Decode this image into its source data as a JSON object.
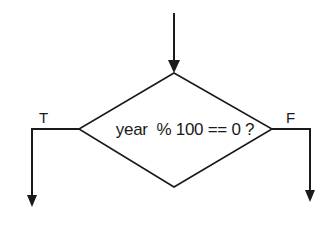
{
  "diagram": {
    "type": "flowchart-decision",
    "decision": {
      "shape": "diamond",
      "text": "year  % 100 == 0 ?"
    },
    "branches": {
      "true_label": "T",
      "false_label": "F"
    },
    "colors": {
      "stroke": "#1a1a1a",
      "background": "#ffffff"
    }
  }
}
